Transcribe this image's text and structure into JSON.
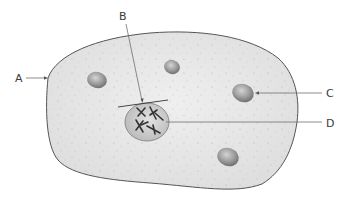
{
  "diagram": {
    "type": "cell-diagram",
    "labels": {
      "A": "A",
      "B": "B",
      "C": "C",
      "D": "D"
    },
    "parts": [
      {
        "label": "A",
        "points_to": "cell membrane"
      },
      {
        "label": "B",
        "points_to": "nuclear region (bracket over nucleus)"
      },
      {
        "label": "C",
        "points_to": "organelle / vesicle"
      },
      {
        "label": "D",
        "points_to": "nucleus with chromosomes"
      }
    ],
    "colors": {
      "cytoplasm": "#e6e6e6",
      "outline": "#555555",
      "organelle": "#8f8f8f",
      "nucleus": "#cfcfcf",
      "chromosome": "#333333",
      "text": "#3a3a3a"
    }
  }
}
